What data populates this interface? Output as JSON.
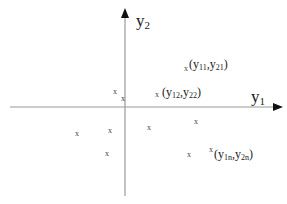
{
  "axes": {
    "origin": {
      "x": 125,
      "y": 107
    },
    "x_axis": {
      "label_base": "y",
      "label_sub": "1",
      "x_start": 10,
      "x_end": 280
    },
    "y_axis": {
      "label_base": "y",
      "label_sub": "2",
      "y_start": 10,
      "y_end": 196
    },
    "color": "#9a9a9a",
    "arrow_color": "#111111"
  },
  "points": [
    {
      "x": 186,
      "y": 69
    },
    {
      "x": 115,
      "y": 92
    },
    {
      "x": 123,
      "y": 99
    },
    {
      "x": 157,
      "y": 95
    },
    {
      "x": 77,
      "y": 134
    },
    {
      "x": 110,
      "y": 131
    },
    {
      "x": 149,
      "y": 128
    },
    {
      "x": 196,
      "y": 122
    },
    {
      "x": 107,
      "y": 154
    },
    {
      "x": 189,
      "y": 155
    },
    {
      "x": 211,
      "y": 150
    }
  ],
  "point_marker": "x",
  "point_labels": [
    {
      "open": "(",
      "a_base": "y",
      "a_sub": "11",
      "sep": ",",
      "b_base": "y",
      "b_sub": "21",
      "close": ")",
      "x": 189,
      "y": 58
    },
    {
      "open": "(",
      "a_base": "y",
      "a_sub": "12",
      "sep": ",",
      "b_base": "y",
      "b_sub": "22",
      "close": ")",
      "x": 162,
      "y": 86
    },
    {
      "open": "(",
      "a_base": "y",
      "a_sub": "1n",
      "sep": ",",
      "b_base": "y",
      "b_sub": "2n",
      "close": ")",
      "x": 214,
      "y": 148
    }
  ]
}
